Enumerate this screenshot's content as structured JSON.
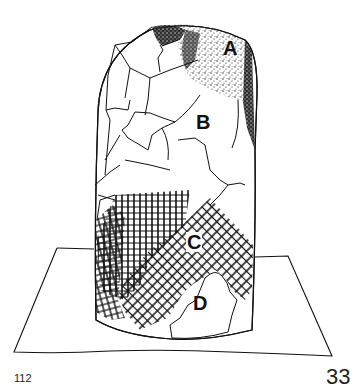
{
  "figure": {
    "regions": [
      {
        "label": "A",
        "fill": "stippled (dots)"
      },
      {
        "label": "B",
        "fill": "plain / cracked surface"
      },
      {
        "label": "C",
        "fill": "cross-hatched"
      },
      {
        "label": "D",
        "fill": "plain"
      }
    ]
  },
  "page": {
    "left_number": "112",
    "right_number": "33"
  }
}
